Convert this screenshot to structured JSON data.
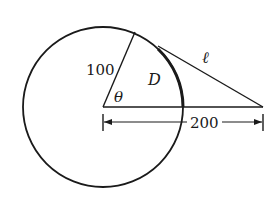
{
  "diagram": {
    "type": "geometry",
    "colors": {
      "stroke": "#1a1a1a",
      "background": "#ffffff"
    },
    "labels": {
      "radius": "100",
      "angle": "θ",
      "region": "D",
      "tangent": "ℓ",
      "distance": "200"
    }
  }
}
